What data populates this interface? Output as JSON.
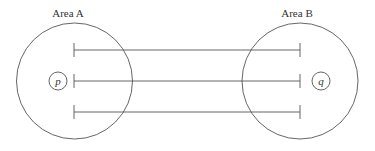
{
  "diagram": {
    "area_a": {
      "label": "Area A",
      "point": "p"
    },
    "area_b": {
      "label": "Area B",
      "point": "q"
    },
    "connections": 3,
    "colors": {
      "stroke": "#555555",
      "text": "#333333",
      "background": "#ffffff"
    }
  }
}
